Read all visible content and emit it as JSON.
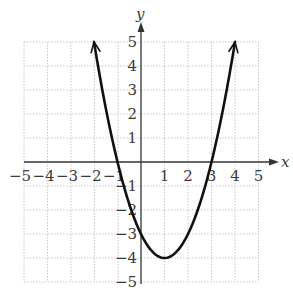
{
  "chart_data": {
    "type": "line",
    "title": "",
    "function": "y = x^2 - 2x - 3",
    "xlabel": "x",
    "ylabel": "y",
    "xlim": [
      -5,
      5
    ],
    "ylim": [
      -5,
      5
    ],
    "grid": true,
    "x_ticks": [
      "-5",
      "-4",
      "-3",
      "-2",
      "-1",
      "1",
      "2",
      "3",
      "4",
      "5"
    ],
    "y_ticks": [
      "5",
      "4",
      "3",
      "2",
      "1",
      "-1",
      "-2",
      "-3",
      "-4",
      "-5"
    ],
    "series": [
      {
        "name": "parabola",
        "x": [
          -2,
          -1,
          0,
          1,
          2,
          3,
          4
        ],
        "y": [
          5,
          0,
          -3,
          -4,
          -3,
          0,
          5
        ]
      }
    ],
    "annotations": {
      "vertex": [
        1,
        -4
      ],
      "x_intercepts": [
        -1,
        3
      ],
      "y_intercept": -3,
      "arrows_at_ends": true
    }
  },
  "labels": {
    "x_axis": "x",
    "y_axis": "y",
    "x_ticks": {
      "n5": "−5",
      "n4": "−4",
      "n3": "−3",
      "n2": "−2",
      "n1": "−1",
      "p1": "1",
      "p2": "2",
      "p3": "3",
      "p4": "4",
      "p5": "5"
    },
    "y_ticks": {
      "p5": "5",
      "p4": "4",
      "p3": "3",
      "p2": "2",
      "p1": "1",
      "n1": "−1",
      "n2": "−2",
      "n3": "−3",
      "n4": "−4",
      "n5": "−5"
    }
  },
  "colors": {
    "curve": "#111111",
    "axis": "#333333",
    "grid": "#c8c8c8"
  }
}
